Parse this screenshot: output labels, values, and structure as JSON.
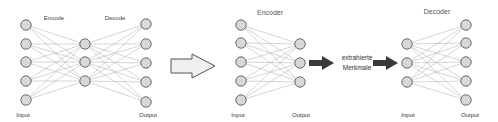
{
  "colors": {
    "node_fill": "#d8d8d8",
    "node_stroke": "#6a6a6a",
    "edge": "#b8b8b8",
    "big_arrow_fill": "#efefef",
    "big_arrow_stroke": "#555555",
    "dark_arrow": "#3a3a3a"
  },
  "left_autoencoder": {
    "encode_label": "Encode",
    "decode_label": "Decode",
    "input_label": "Input",
    "output_label": "Output",
    "layers": [
      {
        "x": 26,
        "ys": [
          25,
          44,
          62,
          81,
          100
        ]
      },
      {
        "x": 85,
        "ys": [
          44,
          62,
          81
        ]
      },
      {
        "x": 146,
        "ys": [
          24,
          44,
          63,
          82,
          102
        ]
      }
    ]
  },
  "transform_arrow": {
    "icon": "big-right-arrow-icon"
  },
  "encoder_net": {
    "title": "Encoder",
    "input_label": "Input",
    "output_label": "Output",
    "layers": [
      {
        "x": 241,
        "ys": [
          25,
          43,
          62,
          81,
          100
        ]
      },
      {
        "x": 300,
        "ys": [
          44,
          63,
          82
        ]
      }
    ]
  },
  "features": {
    "line1": "extrahierte",
    "line2": "Merkmale"
  },
  "decoder_net": {
    "title": "Decoder",
    "input_label": "Input",
    "output_label": "Output",
    "layers": [
      {
        "x": 407,
        "ys": [
          44,
          63,
          82
        ]
      },
      {
        "x": 466,
        "ys": [
          25,
          43,
          62,
          81,
          100
        ]
      }
    ]
  }
}
